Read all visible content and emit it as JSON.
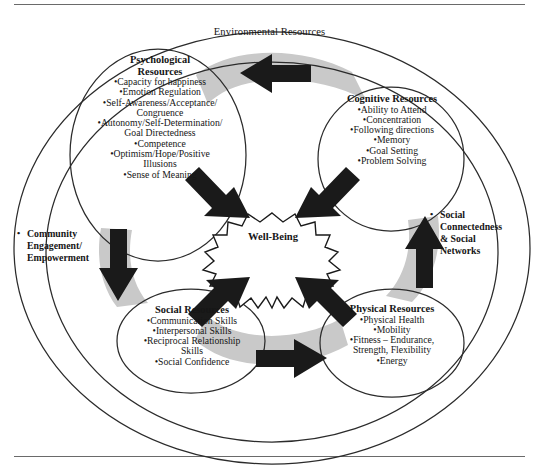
{
  "figure": {
    "title": "Environmental Resources",
    "center": {
      "label": "Well-Being"
    },
    "colors": {
      "arrow_fill": "#1a1a1a",
      "band_fill": "#c9c9c9",
      "outline": "#2b2b2b",
      "rule": "#6a6a6a",
      "background": "#ffffff"
    }
  },
  "nodes": {
    "psychological": {
      "title_line1": "Psychological",
      "title_line2": "Resources",
      "items": [
        "•Capacity for happiness",
        "•Emotion Regulation",
        "•Self-Awareness/Acceptance/",
        "Congruence",
        "•Autonomy/Self-Determination/",
        "Goal Directedness",
        "•Competence",
        "•Optimism/Hope/Positive",
        "Illusions",
        "•Sense of Meaning"
      ]
    },
    "cognitive": {
      "title": "Cognitive Resources",
      "items": [
        "•Ability to Attend",
        "•Concentration",
        "•Following directions",
        "•Memory",
        "•Goal Setting",
        "•Problem Solving"
      ]
    },
    "social": {
      "title": "Social Resources",
      "items": [
        "•Communication Skills",
        "•Interpersonal Skills",
        "•Reciprocal Relationship",
        "Skills",
        "•Social Confidence"
      ]
    },
    "physical": {
      "title": "Physical Resources",
      "items": [
        "•Physical Health",
        "•Mobility",
        "•Fitness – Endurance,",
        "Strength, Flexibility",
        "•Energy"
      ]
    }
  },
  "outer_notes": {
    "community": {
      "bullet": "•",
      "lines": [
        "Community",
        "Engagement/",
        "Empowerment"
      ]
    },
    "social_connectedness": {
      "bullet": "•",
      "lines": [
        "Social",
        "Connectedness",
        "& Social",
        "Networks"
      ]
    }
  },
  "arrows": [
    {
      "name": "cognitive-to-psychological",
      "direction": "left"
    },
    {
      "name": "psychological-to-social",
      "direction": "down"
    },
    {
      "name": "social-to-physical",
      "direction": "right"
    },
    {
      "name": "physical-to-cognitive",
      "direction": "up"
    },
    {
      "name": "psychological-to-wellbeing",
      "direction": "down-right"
    },
    {
      "name": "cognitive-to-wellbeing",
      "direction": "down-left"
    },
    {
      "name": "social-to-wellbeing",
      "direction": "up-right"
    },
    {
      "name": "physical-to-wellbeing",
      "direction": "up-left"
    }
  ]
}
